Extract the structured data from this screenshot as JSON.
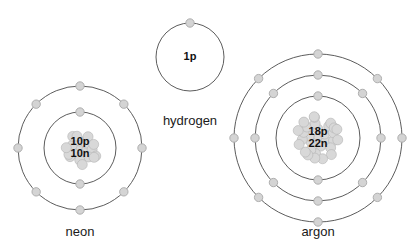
{
  "diagram": {
    "type": "atomic-shell-diagram",
    "background_color": "#ffffff",
    "shell_stroke_color": "#4a4a4a",
    "electron_fill_color": "#d4d4d4",
    "electron_stroke_color": "#a8a8a8",
    "nucleon_fill_color": "#d8d8d8",
    "nucleon_stroke_color": "#b4b4b4",
    "label_text_color": "#1a1a1a"
  },
  "atoms": [
    {
      "id": "hydrogen",
      "label": "hydrogen",
      "nucleus_lines": [
        "1p"
      ],
      "protons": 1,
      "neutrons": 0,
      "nucleus_radius": 0,
      "center": {
        "x": 190,
        "y": 57
      },
      "label_position": {
        "x": 190,
        "y": 122
      },
      "shells": [
        {
          "radius": 34,
          "electron_count": 1,
          "electron_angles": [
            270
          ]
        }
      ]
    },
    {
      "id": "neon",
      "label": "neon",
      "nucleus_lines": [
        "10p",
        "10n"
      ],
      "protons": 10,
      "neutrons": 10,
      "nucleus_radius": 22,
      "center": {
        "x": 80,
        "y": 148
      },
      "label_position": {
        "x": 80,
        "y": 233
      },
      "shells": [
        {
          "radius": 36,
          "electron_count": 2,
          "electron_angles": [
            270,
            90
          ]
        },
        {
          "radius": 62,
          "electron_count": 8,
          "electron_angles": [
            270,
            315,
            0,
            45,
            90,
            135,
            180,
            225
          ]
        }
      ]
    },
    {
      "id": "argon",
      "label": "argon",
      "nucleus_lines": [
        "18p",
        "22n"
      ],
      "protons": 18,
      "neutrons": 22,
      "nucleus_radius": 26,
      "center": {
        "x": 318,
        "y": 138
      },
      "label_position": {
        "x": 318,
        "y": 233
      },
      "shells": [
        {
          "radius": 42,
          "electron_count": 2,
          "electron_angles": [
            270,
            90
          ]
        },
        {
          "radius": 63,
          "electron_count": 8,
          "electron_angles": [
            270,
            315,
            0,
            45,
            90,
            135,
            180,
            225
          ]
        },
        {
          "radius": 84,
          "electron_count": 8,
          "electron_angles": [
            270,
            315,
            0,
            45,
            90,
            135,
            180,
            225
          ]
        }
      ]
    }
  ],
  "geometry": {
    "electron_radius": 4.2,
    "nucleon_ball_radius": 5.0,
    "nucleus_text_line_height": 12
  }
}
